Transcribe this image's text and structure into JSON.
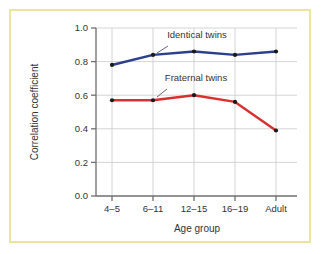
{
  "figure": {
    "border_color": "#ece59c",
    "background_color": "#ffffff"
  },
  "chart_data": {
    "type": "line",
    "title": "",
    "xlabel": "Age group",
    "ylabel": "Correlation coefficient",
    "categories": [
      "4–5",
      "6–11",
      "12–15",
      "16–19",
      "Adult"
    ],
    "ylim": [
      0.0,
      1.0
    ],
    "ytick_labels": [
      "0.0",
      "0.2",
      "0.4",
      "0.6",
      "0.8",
      "1.0"
    ],
    "ytick_values": [
      0.0,
      0.2,
      0.4,
      0.6,
      0.8,
      1.0
    ],
    "grid": true,
    "grid_axis": "y",
    "legend_position": "inline-annotations",
    "series": [
      {
        "name": "Identical twins",
        "color": "#2b3f8c",
        "marker_color": "#1a1a1a",
        "values": [
          0.78,
          0.84,
          0.86,
          0.84,
          0.86
        ],
        "annotation": {
          "label": "Identical twins",
          "text_x": 197,
          "text_y": 38,
          "leader_from_x": 168,
          "leader_from_y": 46,
          "leader_to_x": 157,
          "leader_to_y": 53
        }
      },
      {
        "name": "Fraternal twins",
        "color": "#d8302f",
        "marker_color": "#1a1a1a",
        "values": [
          0.57,
          0.57,
          0.6,
          0.56,
          0.39
        ],
        "annotation": {
          "label": "Fraternal twins",
          "text_x": 196,
          "text_y": 81,
          "leader_from_x": 167,
          "leader_from_y": 89,
          "leader_to_x": 157,
          "leader_to_y": 97
        }
      }
    ]
  },
  "axes": {
    "y_axis_label": "Correlation coefficient",
    "x_axis_label": "Age group",
    "axis_color": "#6f6f6f",
    "grid_color": "#c9c9c9"
  }
}
